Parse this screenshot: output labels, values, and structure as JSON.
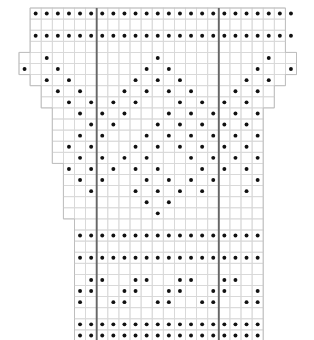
{
  "chart_data": {
    "type": "heatmap",
    "title": "",
    "subtitle": "",
    "xlabel": "",
    "ylabel": "",
    "grid": true,
    "legend_position": "none",
    "columns": 25,
    "rows": 30,
    "cell_px": 11.1,
    "origin_x": 19,
    "origin_y": 8,
    "colors": {
      "dot": "#111111",
      "grid_line": "#d8d8d8",
      "outline": "#bdbdbd",
      "repeat_line": "#666666",
      "background": "#ffffff"
    },
    "repeat_lines_after_column": [
      7,
      18
    ],
    "row_extent": [
      {
        "row": 0,
        "start": 1,
        "end": 24
      },
      {
        "row": 1,
        "start": 1,
        "end": 24
      },
      {
        "row": 2,
        "start": 1,
        "end": 24
      },
      {
        "row": 3,
        "start": 1,
        "end": 24
      },
      {
        "row": 4,
        "start": 0,
        "end": 25
      },
      {
        "row": 5,
        "start": 0,
        "end": 25
      },
      {
        "row": 6,
        "start": 1,
        "end": 24
      },
      {
        "row": 7,
        "start": 2,
        "end": 23
      },
      {
        "row": 8,
        "start": 2,
        "end": 23
      },
      {
        "row": 9,
        "start": 3,
        "end": 22
      },
      {
        "row": 10,
        "start": 3,
        "end": 22
      },
      {
        "row": 11,
        "start": 3,
        "end": 22
      },
      {
        "row": 12,
        "start": 3,
        "end": 22
      },
      {
        "row": 13,
        "start": 3,
        "end": 22
      },
      {
        "row": 14,
        "start": 4,
        "end": 22
      },
      {
        "row": 15,
        "start": 4,
        "end": 22
      },
      {
        "row": 16,
        "start": 4,
        "end": 22
      },
      {
        "row": 17,
        "start": 4,
        "end": 22
      },
      {
        "row": 18,
        "start": 4,
        "end": 22
      },
      {
        "row": 19,
        "start": 5,
        "end": 22
      },
      {
        "row": 20,
        "start": 5,
        "end": 22
      },
      {
        "row": 21,
        "start": 5,
        "end": 22
      },
      {
        "row": 22,
        "start": 5,
        "end": 22
      },
      {
        "row": 23,
        "start": 5,
        "end": 22
      },
      {
        "row": 24,
        "start": 5,
        "end": 22
      },
      {
        "row": 25,
        "start": 5,
        "end": 22
      },
      {
        "row": 26,
        "start": 5,
        "end": 22
      },
      {
        "row": 27,
        "start": 5,
        "end": 22
      },
      {
        "row": 28,
        "start": 5,
        "end": 22
      },
      {
        "row": 29,
        "start": 5,
        "end": 22
      }
    ],
    "dot_rows": [
      {
        "row": 0,
        "cols": [
          1,
          2,
          3,
          4,
          5,
          6,
          7,
          8,
          9,
          10,
          11,
          12,
          13,
          14,
          15,
          16,
          17,
          18,
          19,
          20,
          21,
          22,
          23,
          24
        ]
      },
      {
        "row": 1,
        "cols": []
      },
      {
        "row": 2,
        "cols": [
          1,
          2,
          3,
          4,
          5,
          6,
          7,
          8,
          9,
          10,
          11,
          12,
          13,
          14,
          15,
          16,
          17,
          18,
          19,
          20,
          21,
          22,
          23,
          24
        ]
      },
      {
        "row": 3,
        "cols": []
      },
      {
        "row": 4,
        "cols": [
          2,
          12,
          22
        ]
      },
      {
        "row": 5,
        "cols": [
          0,
          3,
          11,
          13,
          21,
          24
        ]
      },
      {
        "row": 6,
        "cols": [
          2,
          4,
          10,
          12,
          14,
          20,
          22
        ]
      },
      {
        "row": 7,
        "cols": [
          3,
          5,
          9,
          11,
          13,
          15,
          19,
          21
        ]
      },
      {
        "row": 8,
        "cols": [
          4,
          6,
          8,
          10,
          14,
          16,
          18,
          20
        ]
      },
      {
        "row": 9,
        "cols": [
          5,
          7,
          9,
          13,
          15,
          17,
          19,
          21
        ]
      },
      {
        "row": 10,
        "cols": [
          6,
          8,
          12,
          14,
          16,
          18,
          20
        ]
      },
      {
        "row": 11,
        "cols": [
          5,
          7,
          11,
          13,
          15,
          17,
          19,
          21
        ]
      },
      {
        "row": 12,
        "cols": [
          4,
          6,
          10,
          12,
          14,
          16,
          18,
          20
        ]
      },
      {
        "row": 13,
        "cols": [
          5,
          7,
          9,
          11,
          15,
          17,
          19,
          21
        ]
      },
      {
        "row": 14,
        "cols": [
          4,
          6,
          8,
          10,
          12,
          16,
          18,
          20
        ]
      },
      {
        "row": 15,
        "cols": [
          5,
          7,
          11,
          13,
          15,
          17,
          21
        ]
      },
      {
        "row": 16,
        "cols": [
          6,
          10,
          12,
          14,
          16,
          20
        ]
      },
      {
        "row": 17,
        "cols": [
          11,
          13
        ]
      },
      {
        "row": 18,
        "cols": [
          12
        ]
      },
      {
        "row": 19,
        "cols": []
      },
      {
        "row": 20,
        "cols": [
          5,
          6,
          7,
          8,
          9,
          10,
          11,
          12,
          13,
          14,
          15,
          16,
          17,
          18,
          19,
          20,
          21
        ]
      },
      {
        "row": 21,
        "cols": []
      },
      {
        "row": 22,
        "cols": [
          5,
          6,
          7,
          8,
          9,
          10,
          11,
          12,
          13,
          14,
          15,
          16,
          17,
          18,
          19,
          20,
          21
        ]
      },
      {
        "row": 23,
        "cols": []
      },
      {
        "row": 24,
        "cols": [
          6,
          7,
          10,
          11,
          14,
          15,
          18,
          19
        ]
      },
      {
        "row": 25,
        "cols": [
          5,
          6,
          9,
          10,
          13,
          14,
          17,
          18,
          21
        ]
      },
      {
        "row": 26,
        "cols": [
          5,
          8,
          9,
          12,
          13,
          16,
          17,
          20,
          21
        ]
      },
      {
        "row": 27,
        "cols": []
      },
      {
        "row": 28,
        "cols": [
          5,
          6,
          7,
          8,
          9,
          10,
          11,
          12,
          13,
          14,
          15,
          16,
          17,
          18,
          19,
          20,
          21
        ]
      },
      {
        "row": 29,
        "cols": [
          5,
          6,
          7,
          8,
          9,
          10,
          11,
          12,
          13,
          14,
          15,
          16,
          17,
          18,
          19,
          20,
          21
        ]
      }
    ]
  },
  "chart": {
    "caption": ""
  }
}
